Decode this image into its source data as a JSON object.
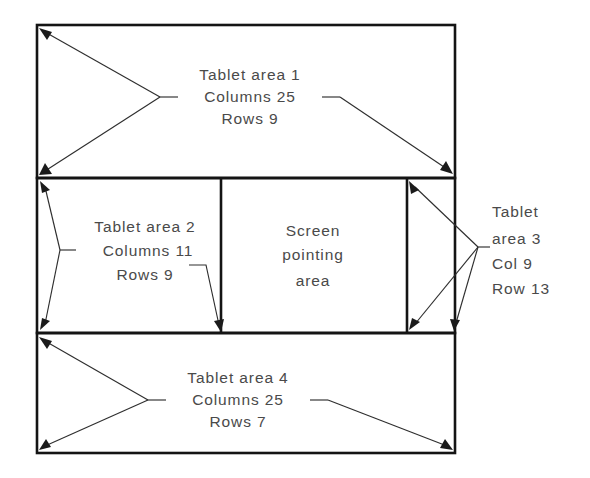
{
  "diagram": {
    "canvas": {
      "width": 590,
      "height": 478
    },
    "colors": {
      "background": "#ffffff",
      "border": "#141414",
      "leader": "#2e2e2e",
      "text": "#4a4a4a"
    },
    "regions": [
      {
        "id": "tablet-area-1",
        "name": "Tablet area 1",
        "lines": [
          "Tablet area 1",
          "Columns 25",
          "Rows 9"
        ],
        "columns": 25,
        "rows": 9,
        "box": {
          "x": 37,
          "y": 25,
          "width": 418,
          "height": 153
        }
      },
      {
        "id": "tablet-area-2",
        "name": "Tablet area 2",
        "lines": [
          "Tablet area 2",
          "Columns 11",
          "Rows 9"
        ],
        "columns": 11,
        "rows": 9,
        "box": {
          "x": 37,
          "y": 178,
          "width": 184,
          "height": 155
        }
      },
      {
        "id": "screen-pointing-area",
        "name": "Screen pointing area",
        "lines": [
          "Screen",
          "pointing",
          "area"
        ],
        "box": {
          "x": 221,
          "y": 178,
          "width": 186,
          "height": 155
        }
      },
      {
        "id": "tablet-area-3",
        "name": "Tablet area 3",
        "lines": [
          "Tablet",
          "area 3",
          "Col 9",
          "Row 13"
        ],
        "columns": 9,
        "rows": 13,
        "box": {
          "x": 407,
          "y": 178,
          "width": 48,
          "height": 155
        }
      },
      {
        "id": "tablet-area-4",
        "name": "Tablet area 4",
        "lines": [
          "Tablet area 4",
          "Columns 25",
          "Rows 7"
        ],
        "columns": 25,
        "rows": 7,
        "box": {
          "x": 37,
          "y": 333,
          "width": 418,
          "height": 120
        }
      }
    ],
    "labels": {
      "area1": {
        "line1": "Tablet area 1",
        "line2": "Columns 25",
        "line3": "Rows 9",
        "x": 250,
        "y1": 76,
        "y2": 98,
        "y3": 120
      },
      "area2": {
        "line1": "Tablet area 2",
        "line2": "Columns 11",
        "line3": "Rows 9",
        "x": 145,
        "y1": 228,
        "y2": 252,
        "y3": 276
      },
      "screen": {
        "line1": "Screen",
        "line2": "pointing",
        "line3": "area",
        "x": 313,
        "y1": 232,
        "y2": 256,
        "y3": 282
      },
      "area3": {
        "line1": "Tablet",
        "line2": "area 3",
        "line3": "Col 9",
        "line4": "Row 13",
        "x": 492,
        "y1": 213,
        "y2": 240,
        "y3": 265,
        "y4": 290
      },
      "area4": {
        "line1": "Tablet area 4",
        "line2": "Columns 25",
        "line3": "Rows 7",
        "x": 238,
        "y1": 379,
        "y2": 401,
        "y3": 423
      }
    }
  }
}
